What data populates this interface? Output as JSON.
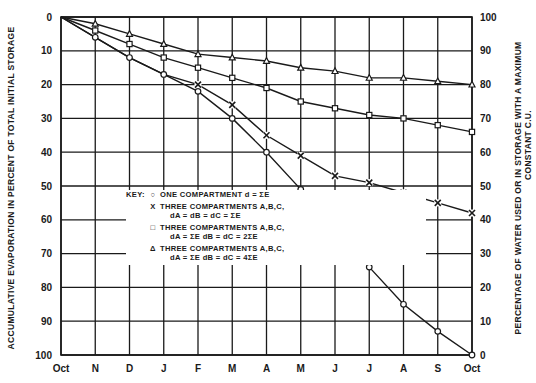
{
  "chart_data": {
    "type": "line",
    "title": "",
    "xlabel": "",
    "ylabel": "ACCUMULATIVE EVAPORATION IN PERCENT OF TOTAL INITIAL STORAGE",
    "ylabel_right": [
      "PERCENTAGE OF WATER USED OR IN STORAGE WITH A MAXIMUM",
      "CONSTANT C.U."
    ],
    "categories": [
      "Oct",
      "N",
      "D",
      "J",
      "F",
      "M",
      "A",
      "M",
      "J",
      "J",
      "A",
      "S",
      "Oct"
    ],
    "ylim": [
      0,
      100
    ],
    "y_inverted": true,
    "y_ticks": [
      0,
      10,
      20,
      30,
      40,
      50,
      60,
      70,
      80,
      90,
      100
    ],
    "y_right_ticks": [
      100,
      90,
      80,
      70,
      60,
      50,
      40,
      30,
      20,
      10,
      0
    ],
    "grid": true,
    "series": [
      {
        "name": "ONE COMPARTMENT d = ΣE",
        "marker": "circle",
        "values": [
          0,
          6,
          12,
          17,
          22,
          30,
          40,
          51,
          63,
          74,
          85,
          93,
          100
        ]
      },
      {
        "name": "THREE COMPARTMENTS A,B,C, dA = dB = dC = ΣE",
        "marker": "x",
        "values": [
          0,
          6,
          12,
          17,
          20,
          26,
          35,
          41,
          47,
          49,
          52,
          55,
          58
        ]
      },
      {
        "name": "THREE COMPARTMENTS A,B,C, dA = ΣE dB = dC = 2ΣE",
        "marker": "square",
        "values": [
          0,
          4,
          8,
          12,
          15,
          18,
          21,
          25,
          27,
          29,
          30,
          32,
          34
        ]
      },
      {
        "name": "THREE COMPARTMENTS A,B,C, dA = ΣE dB = dC = 4ΣE",
        "marker": "triangle",
        "values": [
          0,
          2,
          5,
          8,
          11,
          12,
          13,
          15,
          16,
          18,
          18,
          19,
          20
        ]
      }
    ],
    "x_marker_start_index": 4,
    "legend_position": "inside-lower-center"
  },
  "legend": {
    "key_label": "KEY:",
    "items": [
      {
        "symbol": "○",
        "line1": "ONE COMPARTMENT  d = ΣE",
        "line2": ""
      },
      {
        "symbol": "X",
        "line1": "THREE COMPARTMENTS A,B,C,",
        "line2": "dA = dB = dC = ΣE"
      },
      {
        "symbol": "□",
        "line1": "THREE COMPARTMENTS A,B,C,",
        "line2": "dA = ΣE   dB = dC = 2ΣE"
      },
      {
        "symbol": "Δ",
        "line1": "THREE COMPARTMENTS A,B,C,",
        "line2": "dA = ΣE   dB = dC = 4ΣE"
      }
    ]
  },
  "colors": {
    "ink": "#1a1a1a",
    "background": "#ffffff"
  }
}
